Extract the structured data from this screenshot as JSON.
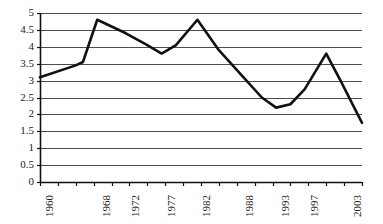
{
  "chart_data": {
    "type": "line",
    "title": "",
    "subtitle": "",
    "xlabel": "",
    "ylabel": "",
    "ylim": [
      0,
      5
    ],
    "ytick_values": [
      0,
      0.5,
      1,
      1.5,
      2,
      2.5,
      3,
      3.5,
      4,
      4.5,
      5
    ],
    "ytick_labels": [
      "0",
      "0.5",
      "1",
      "1.5",
      "2",
      "2.5",
      "3",
      "3.5",
      "4",
      "4.5",
      "5"
    ],
    "xtick_labels": [
      "1960",
      "1968",
      "1972",
      "1977",
      "1982",
      "1988",
      "1993",
      "1997",
      "2003"
    ],
    "xtick_label_years": [
      1960,
      1968,
      1972,
      1977,
      1982,
      1988,
      1993,
      1997,
      2003
    ],
    "xlim": [
      1960,
      2005
    ],
    "x_tick_count": 19,
    "grid": "horizontal",
    "legend": "none",
    "series": [
      {
        "name": "value",
        "x": [
          1960,
          1965,
          1966,
          1968,
          1972,
          1975,
          1977,
          1979,
          1982,
          1985,
          1988,
          1991,
          1993,
          1995,
          1997,
          2000,
          2002,
          2005
        ],
        "values": [
          3.1,
          3.45,
          3.55,
          4.8,
          4.4,
          4.05,
          3.8,
          4.05,
          4.8,
          3.9,
          3.2,
          2.5,
          2.2,
          2.3,
          2.75,
          3.8,
          3.0,
          1.75
        ],
        "color": "#111111",
        "line_width": 2.6
      }
    ],
    "axis_color": "#111111",
    "grid_color": "#4d4d4d",
    "background": "#ffffff"
  },
  "plot_geometry": {
    "left": 40,
    "right": 362,
    "top": 13,
    "bottom": 182
  }
}
